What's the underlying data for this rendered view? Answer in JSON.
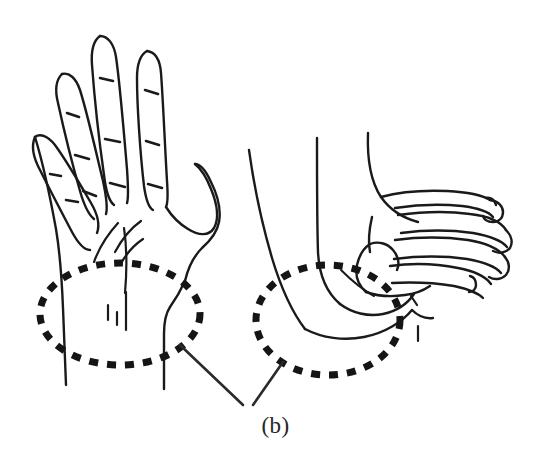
{
  "figure": {
    "caption": "(b)",
    "caption_position": "bottom-center",
    "background_color": "#ffffff",
    "ink_color": "#1a1a1a",
    "highlight_color": "#151515",
    "style": "black-and-white line drawing",
    "width": 551,
    "height": 465
  },
  "panels": [
    {
      "id": "left-hand",
      "view": "palmar-dorsal-open-hand",
      "description": "open hand with four extended fingers and abducted thumb, wrist and forearm below",
      "digits": [
        "little-finger",
        "ring-finger",
        "middle-finger",
        "index-finger",
        "thumb"
      ],
      "features": [
        "finger-crease-marks",
        "palm-crease-lines",
        "wrist-lines"
      ]
    },
    {
      "id": "right-hand",
      "view": "lateral-flexed-hand",
      "description": "side view of hand with flexed curled fingers and forearm",
      "digits": [
        "thumb",
        "index-finger",
        "middle-finger",
        "ring-finger",
        "little-finger"
      ],
      "features": [
        "knuckle-contours",
        "thenar-eminence",
        "wrist-lines"
      ]
    }
  ],
  "annotations": {
    "highlight_regions": [
      {
        "id": "left-wrist-highlight",
        "shape": "dashed-ellipse",
        "target": "left hand wrist / carpal region",
        "center": [
          120,
          314
        ],
        "radius_x": 80,
        "radius_y": 51
      },
      {
        "id": "right-wrist-highlight",
        "shape": "dashed-ellipse",
        "target": "right hand wrist / carpal region",
        "center": [
          328,
          320
        ],
        "radius_x": 72,
        "radius_y": 55
      }
    ],
    "leader_lines": [
      {
        "id": "left-leader",
        "from": [
          180,
          345
        ],
        "to": [
          243,
          405
        ]
      },
      {
        "id": "right-leader",
        "from": [
          283,
          362
        ],
        "to": [
          253,
          405
        ]
      }
    ]
  }
}
